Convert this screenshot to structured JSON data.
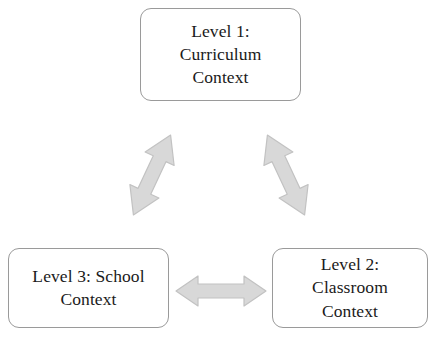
{
  "diagram": {
    "background_color": "#ffffff",
    "node_border_color": "#9a9a9a",
    "node_text_color": "#1a1a1a",
    "arrow_fill_color": "#d8d8d8",
    "arrow_stroke_color": "#bcbcbc",
    "nodes": [
      {
        "id": "level1",
        "label": "Level 1:\nCurriculum\nContext",
        "position": "top-center"
      },
      {
        "id": "level3",
        "label": "Level 3: School\nContext",
        "position": "bottom-left"
      },
      {
        "id": "level2",
        "label": "Level 2:\nClassroom\nContext",
        "position": "bottom-right"
      }
    ],
    "arrows": [
      {
        "id": "left-diagonal",
        "connects": [
          "level3",
          "level1"
        ],
        "direction": "bidirectional",
        "orientation": "diagonal-up-right"
      },
      {
        "id": "right-diagonal",
        "connects": [
          "level1",
          "level2"
        ],
        "direction": "bidirectional",
        "orientation": "diagonal-down-right"
      },
      {
        "id": "bottom-horizontal",
        "connects": [
          "level3",
          "level2"
        ],
        "direction": "bidirectional",
        "orientation": "horizontal"
      }
    ]
  }
}
